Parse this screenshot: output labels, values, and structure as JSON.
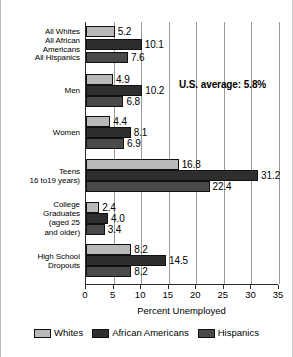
{
  "chart_data": {
    "type": "bar",
    "orientation": "horizontal",
    "title": "",
    "xlabel": "Percent Unemployed",
    "ylabel": "",
    "xlim": [
      0,
      35
    ],
    "xticks": [
      0,
      5,
      10,
      15,
      20,
      25,
      30,
      35
    ],
    "grid": true,
    "legend_position": "bottom",
    "categories": [
      "All Whites",
      "All African\nAmericans",
      "All Hispanics",
      "Men",
      "Women",
      "Teens\n16 to19 years)",
      "College\nGraduates\n(aged 25\nand older)",
      "High School\nDropouts"
    ],
    "groups": [
      {
        "label": "All Whites",
        "single_series": "Whites",
        "bars": [
          {
            "series": "Whites",
            "value": 5.2
          }
        ]
      },
      {
        "label": "All African\nAmericans",
        "single_series": "African Americans",
        "bars": [
          {
            "series": "African Americans",
            "value": 10.1
          }
        ]
      },
      {
        "label": "All Hispanics",
        "single_series": "Hispanics",
        "bars": [
          {
            "series": "Hispanics",
            "value": 7.6
          }
        ]
      },
      {
        "label": "Men",
        "bars": [
          {
            "series": "Whites",
            "value": 4.9
          },
          {
            "series": "African Americans",
            "value": 10.2
          },
          {
            "series": "Hispanics",
            "value": 6.8
          }
        ]
      },
      {
        "label": "Women",
        "bars": [
          {
            "series": "Whites",
            "value": 4.4
          },
          {
            "series": "African Americans",
            "value": 8.1
          },
          {
            "series": "Hispanics",
            "value": 6.9
          }
        ]
      },
      {
        "label": "Teens\n16 to19 years)",
        "bars": [
          {
            "series": "Whites",
            "value": 16.8
          },
          {
            "series": "African Americans",
            "value": 31.2
          },
          {
            "series": "Hispanics",
            "value": 22.4
          }
        ]
      },
      {
        "label": "College\nGraduates\n(aged 25\nand older)",
        "bars": [
          {
            "series": "Whites",
            "value": 2.4
          },
          {
            "series": "African Americans",
            "value": 4.0
          },
          {
            "series": "Hispanics",
            "value": 3.4
          }
        ]
      },
      {
        "label": "High School\nDropouts",
        "bars": [
          {
            "series": "Whites",
            "value": 8.2
          },
          {
            "series": "African Americans",
            "value": 14.5
          },
          {
            "series": "Hispanics",
            "value": 8.2
          }
        ]
      }
    ],
    "series": [
      {
        "name": "Whites",
        "color": "#b9b9b9",
        "values": [
          5.2,
          null,
          null,
          4.9,
          4.4,
          16.8,
          2.4,
          8.2
        ]
      },
      {
        "name": "African Americans",
        "color": "#2e2e2e",
        "values": [
          null,
          10.1,
          null,
          10.2,
          8.1,
          31.2,
          4.0,
          14.5
        ]
      },
      {
        "name": "Hispanics",
        "color": "#4a4a4a",
        "values": [
          null,
          null,
          7.6,
          6.8,
          6.9,
          22.4,
          3.4,
          8.2
        ]
      }
    ],
    "annotations": [
      {
        "text": "U.S. average: 5.8%",
        "x": 17.5,
        "bold": true
      }
    ]
  },
  "legend": {
    "items": [
      {
        "label": "Whites",
        "color": "#b9b9b9"
      },
      {
        "label": "African Americans",
        "color": "#2e2e2e"
      },
      {
        "label": "Hispanics",
        "color": "#4a4a4a"
      }
    ]
  },
  "axis": {
    "xlabel": "Percent Unemployed",
    "ticklabels": [
      "0",
      "5",
      "10",
      "15",
      "20",
      "25",
      "30",
      "35"
    ]
  },
  "annotation": {
    "us_average": "U.S. average: 5.8%"
  }
}
